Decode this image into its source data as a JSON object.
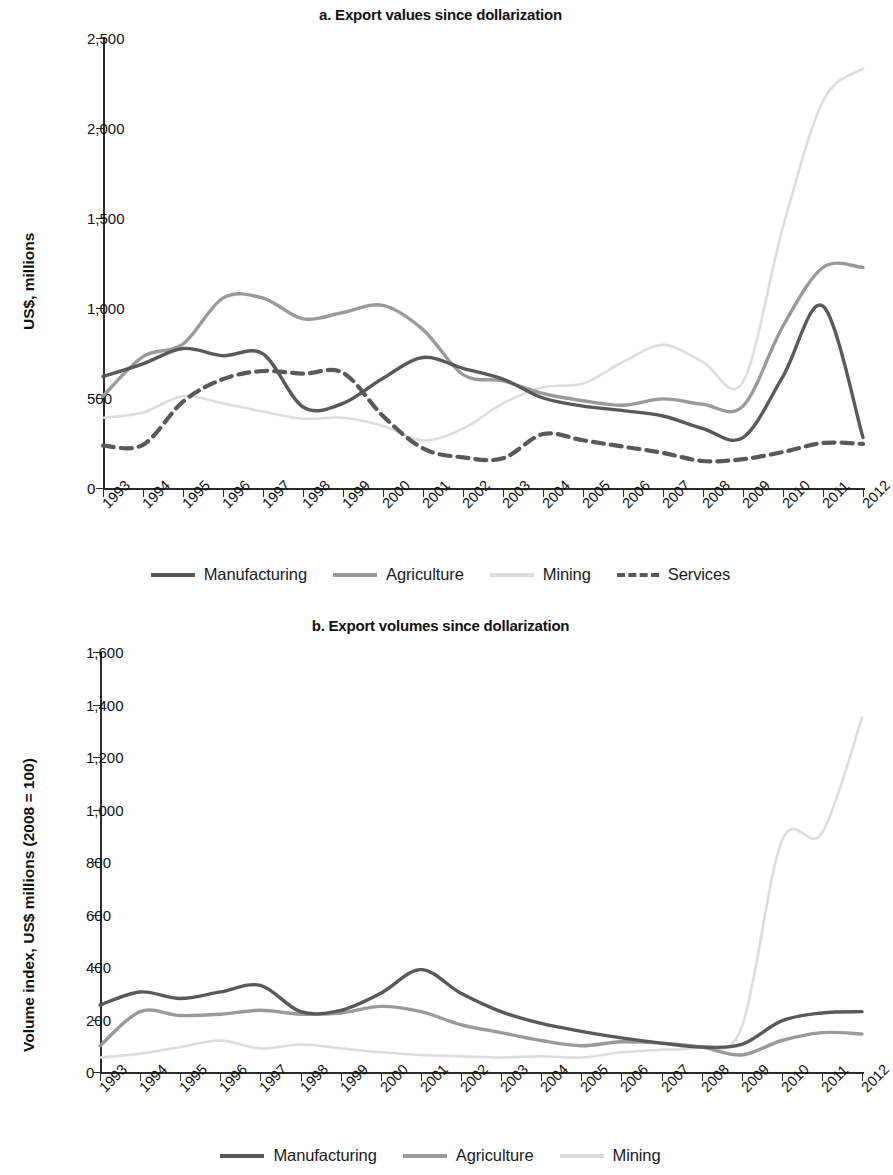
{
  "figure": {
    "panel_a_title": "a. Export values since dollarization",
    "panel_b_title": "b. Export volumes since dollarization"
  },
  "colors": {
    "manufacturing": "#595959",
    "agriculture": "#9a9a9a",
    "mining": "#dcdcdc",
    "services": "#595959",
    "axis": "#2b2b2b",
    "text": "#111111"
  },
  "legend_a": [
    {
      "label": "Manufacturing",
      "color": "#595959",
      "style": "solid"
    },
    {
      "label": "Agriculture",
      "color": "#9a9a9a",
      "style": "solid"
    },
    {
      "label": "Mining",
      "color": "#dcdcdc",
      "style": "solid"
    },
    {
      "label": "Services",
      "color": "#595959",
      "style": "dashed"
    }
  ],
  "legend_b": [
    {
      "label": "Manufacturing",
      "color": "#595959",
      "style": "solid"
    },
    {
      "label": "Agriculture",
      "color": "#9a9a9a",
      "style": "solid"
    },
    {
      "label": "Mining",
      "color": "#dcdcdc",
      "style": "solid"
    }
  ],
  "chart_data": [
    {
      "id": "a",
      "type": "line",
      "title": "a. Export values since dollarization",
      "xlabel": "",
      "ylabel": "US$, millions",
      "ylim": [
        0,
        2500
      ],
      "yticks": [
        0,
        500,
        1000,
        1500,
        2000,
        2500
      ],
      "ytick_labels": [
        "0",
        "500",
        "1,000",
        "1,500",
        "2,000",
        "2,500"
      ],
      "grid": false,
      "legend_position": "bottom",
      "x": [
        1993,
        1994,
        1995,
        1996,
        1997,
        1998,
        1999,
        2000,
        2001,
        2002,
        2003,
        2004,
        2005,
        2006,
        2007,
        2008,
        2009,
        2010,
        2011,
        2012
      ],
      "xtick_labels": [
        "1993",
        "1994",
        "1995",
        "1996",
        "1997",
        "1998",
        "1999",
        "2000",
        "2001",
        "2002",
        "2003",
        "2004",
        "2005",
        "2006",
        "2007",
        "2008",
        "2009",
        "2010",
        "2011",
        "2012"
      ],
      "series": [
        {
          "name": "Manufacturing",
          "color": "#595959",
          "style": "solid",
          "values": [
            620,
            690,
            775,
            735,
            745,
            450,
            470,
            610,
            725,
            665,
            605,
            500,
            455,
            430,
            400,
            330,
            280,
            620,
            1010,
            280
          ]
        },
        {
          "name": "Agriculture",
          "color": "#9a9a9a",
          "style": "solid",
          "values": [
            510,
            730,
            800,
            1055,
            1055,
            940,
            975,
            1015,
            880,
            630,
            595,
            525,
            485,
            460,
            495,
            465,
            455,
            900,
            1225,
            1225
          ]
        },
        {
          "name": "Mining",
          "color": "#dcdcdc",
          "style": "solid",
          "values": [
            390,
            420,
            510,
            470,
            425,
            385,
            390,
            345,
            265,
            330,
            470,
            560,
            580,
            700,
            795,
            700,
            590,
            1450,
            2150,
            2330
          ]
        },
        {
          "name": "Services",
          "color": "#595959",
          "style": "dashed",
          "values": [
            235,
            240,
            480,
            605,
            650,
            635,
            640,
            400,
            220,
            170,
            165,
            300,
            265,
            230,
            195,
            150,
            160,
            200,
            250,
            245
          ]
        }
      ]
    },
    {
      "id": "b",
      "type": "line",
      "title": "b. Export volumes since dollarization",
      "xlabel": "",
      "ylabel": "Volume index, US$ millions (2008 = 100)",
      "ylim": [
        0,
        1600
      ],
      "yticks": [
        0,
        200,
        400,
        600,
        800,
        1000,
        1200,
        1400,
        1600
      ],
      "ytick_labels": [
        "0",
        "200",
        "400",
        "600",
        "800",
        "1,000",
        "1,200",
        "1,400",
        "1,600"
      ],
      "grid": false,
      "legend_position": "bottom",
      "x": [
        1993,
        1994,
        1995,
        1996,
        1997,
        1998,
        1999,
        2000,
        2001,
        2002,
        2003,
        2004,
        2005,
        2006,
        2007,
        2008,
        2009,
        2010,
        2011,
        2012
      ],
      "xtick_labels": [
        "1993",
        "1994",
        "1995",
        "1996",
        "1997",
        "1998",
        "1999",
        "2000",
        "2001",
        "2002",
        "2003",
        "2004",
        "2005",
        "2006",
        "2007",
        "2008",
        "2009",
        "2010",
        "2011",
        "2012"
      ],
      "series": [
        {
          "name": "Manufacturing",
          "color": "#595959",
          "style": "solid",
          "values": [
            255,
            305,
            280,
            305,
            330,
            230,
            235,
            300,
            390,
            300,
            230,
            185,
            155,
            130,
            110,
            95,
            105,
            195,
            225,
            230
          ]
        },
        {
          "name": "Agriculture",
          "color": "#9a9a9a",
          "style": "solid",
          "values": [
            100,
            230,
            215,
            220,
            235,
            220,
            225,
            250,
            230,
            180,
            150,
            120,
            100,
            115,
            110,
            95,
            65,
            120,
            150,
            145
          ]
        },
        {
          "name": "Mining",
          "color": "#dcdcdc",
          "style": "solid",
          "values": [
            55,
            70,
            95,
            120,
            90,
            105,
            90,
            75,
            65,
            60,
            55,
            60,
            55,
            75,
            85,
            95,
            170,
            880,
            910,
            1350
          ]
        }
      ]
    }
  ]
}
